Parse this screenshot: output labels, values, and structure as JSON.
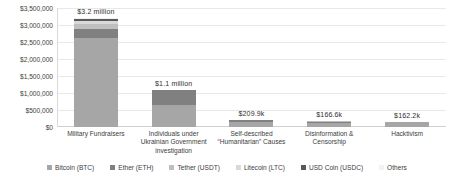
{
  "chart_data": {
    "type": "bar",
    "stacked": true,
    "title": "",
    "subtitle": "",
    "xlabel": "",
    "ylabel": "",
    "ylim": [
      0,
      3500000
    ],
    "grid": true,
    "legend_position": "bottom",
    "categories": [
      "Military Fundraisers",
      "Individuals under Ukrainian Government investigation",
      "Self-described “Humanitarian” Causes",
      "Disinformation & Censorship",
      "Hacktivism"
    ],
    "ytick_labels": [
      "$3,500,000",
      "$3,000,000",
      "$2,500,000",
      "$2,000,000",
      "$1,500,000",
      "$1,000,000",
      "$500,000",
      "$0"
    ],
    "ytick_values": [
      3500000,
      3000000,
      2500000,
      2000000,
      1500000,
      1000000,
      500000,
      0
    ],
    "data_labels": [
      "$3.2 million",
      "$1.1 million",
      "$209.9k",
      "$166.6k",
      "$162.2k"
    ],
    "totals": [
      3200000,
      1100000,
      209900,
      166600,
      162200
    ],
    "series": [
      {
        "name": "Bitcoin (BTC)",
        "color": "#a6a6a6",
        "values": [
          2620000,
          640000,
          150000,
          120000,
          140000
        ]
      },
      {
        "name": "Ether (ETH)",
        "color": "#808080",
        "values": [
          260000,
          460000,
          52000,
          40000,
          18000
        ]
      },
      {
        "name": "Tether (USDT)",
        "color": "#bfbfbf",
        "values": [
          160000,
          0,
          5000,
          4000,
          3000
        ]
      },
      {
        "name": "Litecoin (LTC)",
        "color": "#d9d9d9",
        "values": [
          70000,
          0,
          1500,
          1500,
          700
        ]
      },
      {
        "name": "USD Coin (USDC)",
        "color": "#595959",
        "values": [
          60000,
          0,
          900,
          800,
          400
        ]
      },
      {
        "name": "Others",
        "color": "#f2f2f2",
        "values": [
          30000,
          0,
          500,
          300,
          100
        ]
      }
    ]
  },
  "legend": {
    "items": [
      {
        "label": "Bitcoin (BTC)",
        "color": "#a6a6a6"
      },
      {
        "label": "Ether (ETH)",
        "color": "#808080"
      },
      {
        "label": "Tether (USDT)",
        "color": "#bfbfbf"
      },
      {
        "label": "Litecoin (LTC)",
        "color": "#d9d9d9"
      },
      {
        "label": "USD Coin (USDC)",
        "color": "#595959"
      },
      {
        "label": "Others",
        "color": "#f2f2f2"
      }
    ]
  },
  "style": {
    "background": "#ffffff",
    "grid_color": "#e8e8e8",
    "text_color": "#3d3d3d"
  }
}
